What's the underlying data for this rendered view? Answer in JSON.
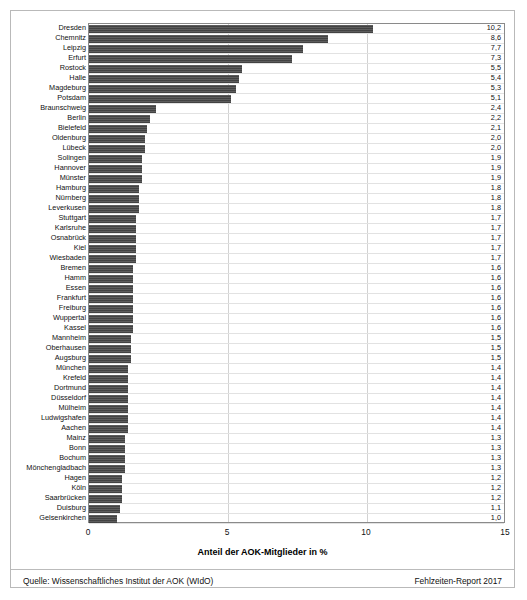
{
  "chart_data": {
    "type": "bar",
    "orientation": "horizontal",
    "title": "",
    "xlabel": "Anteil der AOK-Mitglieder in %",
    "ylabel": "",
    "xlim": [
      0,
      15
    ],
    "xticks": [
      "0",
      "5",
      "10",
      "15"
    ],
    "xtick_values": [
      0,
      5,
      10,
      15
    ],
    "gridlines": [
      5,
      10
    ],
    "grid": true,
    "legend": null,
    "value_label_format": "comma-decimal",
    "bar_color": "#4a4a4a",
    "categories": [
      "Dresden",
      "Chemnitz",
      "Leipzig",
      "Erfurt",
      "Rostock",
      "Halle",
      "Magdeburg",
      "Potsdam",
      "Braunschweig",
      "Berlin",
      "Bielefeld",
      "Oldenburg",
      "Lübeck",
      "Solingen",
      "Hannover",
      "Münster",
      "Hamburg",
      "Nürnberg",
      "Leverkusen",
      "Stuttgart",
      "Karlsruhe",
      "Osnabrück",
      "Kiel",
      "Wiesbaden",
      "Bremen",
      "Hamm",
      "Essen",
      "Frankfurt",
      "Freiburg",
      "Wuppertal",
      "Kassel",
      "Mannheim",
      "Oberhausen",
      "Augsburg",
      "München",
      "Krefeld",
      "Dortmund",
      "Düsseldorf",
      "Mülheim",
      "Ludwigshafen",
      "Aachen",
      "Mainz",
      "Bonn",
      "Bochum",
      "Mönchengladbach",
      "Hagen",
      "Köln",
      "Saarbrücken",
      "Duisburg",
      "Gelsenkirchen"
    ],
    "values": [
      10.2,
      8.6,
      7.7,
      7.3,
      5.5,
      5.4,
      5.3,
      5.1,
      2.4,
      2.2,
      2.1,
      2.0,
      2.0,
      1.9,
      1.9,
      1.9,
      1.8,
      1.8,
      1.8,
      1.7,
      1.7,
      1.7,
      1.7,
      1.7,
      1.6,
      1.6,
      1.6,
      1.6,
      1.6,
      1.6,
      1.6,
      1.5,
      1.5,
      1.5,
      1.4,
      1.4,
      1.4,
      1.4,
      1.4,
      1.4,
      1.4,
      1.3,
      1.3,
      1.3,
      1.3,
      1.2,
      1.2,
      1.2,
      1.1,
      1.0
    ],
    "value_labels": [
      "10,2",
      "8,6",
      "7,7",
      "7,3",
      "5,5",
      "5,4",
      "5,3",
      "5,1",
      "2,4",
      "2,2",
      "2,1",
      "2,0",
      "2,0",
      "1,9",
      "1,9",
      "1,9",
      "1,8",
      "1,8",
      "1,8",
      "1,7",
      "1,7",
      "1,7",
      "1,7",
      "1,7",
      "1,6",
      "1,6",
      "1,6",
      "1,6",
      "1,6",
      "1,6",
      "1,6",
      "1,5",
      "1,5",
      "1,5",
      "1,4",
      "1,4",
      "1,4",
      "1,4",
      "1,4",
      "1,4",
      "1,4",
      "1,3",
      "1,3",
      "1,3",
      "1,3",
      "1,2",
      "1,2",
      "1,2",
      "1,1",
      "1,0"
    ]
  },
  "footer": {
    "source": "Quelle: Wissenschaftliches Institut der AOK (WIdO)",
    "report": "Fehlzeiten-Report 2017"
  }
}
